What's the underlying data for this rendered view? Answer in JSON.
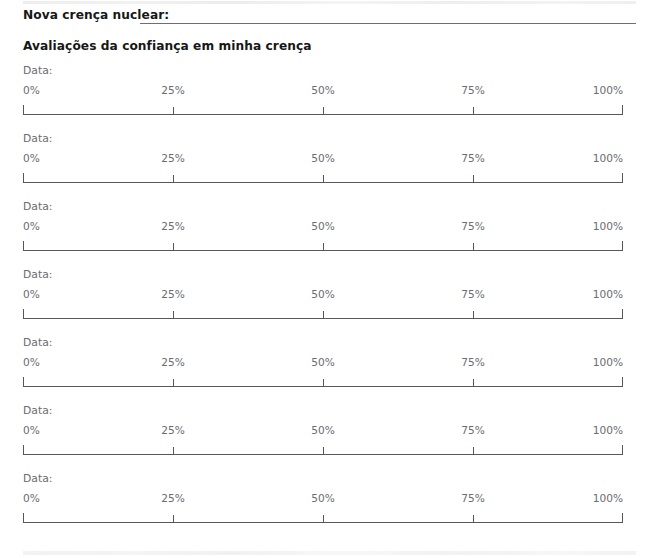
{
  "document": {
    "language": "pt-BR",
    "background_color": "#ffffff",
    "rule_color": "#6e6e72",
    "ruler_color": "#58585c",
    "heading_color": "#171717",
    "muted_text_color": "#6c6c70"
  },
  "field": {
    "label": "Nova crença nuclear:",
    "value": "",
    "placeholder": ""
  },
  "section": {
    "heading": "Avaliações da confiança em minha crença"
  },
  "scale": {
    "tick_labels": [
      "0%",
      "25%",
      "50%",
      "75%",
      "100%"
    ],
    "tick_values": [
      0,
      25,
      50,
      75,
      100
    ],
    "min": 0,
    "max": 100
  },
  "rating_blocks": [
    {
      "date_label": "Data:",
      "date_value": "",
      "rating": null
    },
    {
      "date_label": "Data:",
      "date_value": "",
      "rating": null
    },
    {
      "date_label": "Data:",
      "date_value": "",
      "rating": null
    },
    {
      "date_label": "Data:",
      "date_value": "",
      "rating": null
    },
    {
      "date_label": "Data:",
      "date_value": "",
      "rating": null
    },
    {
      "date_label": "Data:",
      "date_value": "",
      "rating": null
    },
    {
      "date_label": "Data:",
      "date_value": "",
      "rating": null
    }
  ],
  "layout": {
    "block_start_y": 64,
    "block_pitch": 68
  }
}
